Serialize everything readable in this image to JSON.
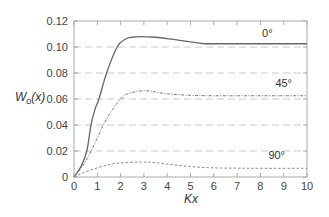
{
  "chart_data": {
    "type": "line",
    "title": "",
    "xlabel": "Kx",
    "ylabel": "W_o(x)",
    "ylabel_parts": {
      "main": "W",
      "sub": "o",
      "arg": "(x)"
    },
    "xlim": [
      0,
      10
    ],
    "ylim": [
      0,
      0.12
    ],
    "x_ticks": [
      0,
      1,
      2,
      3,
      4,
      5,
      6,
      7,
      8,
      9,
      10
    ],
    "x_tick_labels": [
      "0",
      "1",
      "2",
      "3",
      "4",
      "5",
      "6",
      "7",
      "8",
      "9",
      "10"
    ],
    "y_ticks": [
      0,
      0.02,
      0.04,
      0.06,
      0.08,
      0.1,
      0.12
    ],
    "y_tick_labels": [
      "0",
      "0.02",
      "0.04",
      "0.06",
      "0.08",
      "0.10",
      "0.12"
    ],
    "grid": {
      "horizontal": true,
      "vertical": false,
      "style": "dashed",
      "values": [
        0.02,
        0.04,
        0.06,
        0.08,
        0.1
      ]
    },
    "legend": "inline labels",
    "series": [
      {
        "name": "0°",
        "style": "solid",
        "color": "#666666",
        "label_pos": {
          "x": 8.3,
          "y": 0.108
        },
        "x": [
          0,
          0.3,
          0.55,
          0.73,
          0.9,
          1.07,
          1.4,
          1.85,
          2.2,
          2.5,
          2.85,
          3.5,
          4.2,
          5.0,
          5.5,
          6.0,
          8.0,
          10.0
        ],
        "y": [
          0,
          0.008,
          0.02,
          0.04,
          0.052,
          0.06,
          0.08,
          0.1,
          0.106,
          0.1075,
          0.108,
          0.1075,
          0.106,
          0.104,
          0.1027,
          0.1025,
          0.1025,
          0.1025
        ]
      },
      {
        "name": "45°",
        "style": "dash-dot",
        "color": "#777777",
        "label_pos": {
          "x": 9.0,
          "y": 0.069
        },
        "x": [
          0,
          0.5,
          1.0,
          1.3,
          1.7,
          2.1,
          2.5,
          3.0,
          3.5,
          4.0,
          5.0,
          6.0,
          8.0,
          10.0
        ],
        "y": [
          0,
          0.012,
          0.03,
          0.0415,
          0.053,
          0.062,
          0.065,
          0.0664,
          0.0655,
          0.064,
          0.0628,
          0.0625,
          0.0625,
          0.0625
        ]
      },
      {
        "name": "90°",
        "style": "dotted",
        "color": "#888888",
        "label_pos": {
          "x": 8.7,
          "y": 0.0135
        },
        "x": [
          0,
          0.5,
          1.0,
          1.5,
          2.0,
          2.85,
          3.5,
          4.2,
          5.0,
          6.0,
          7.0,
          8.0,
          10.0
        ],
        "y": [
          0,
          0.004,
          0.007,
          0.0095,
          0.0108,
          0.0115,
          0.011,
          0.0095,
          0.008,
          0.007,
          0.0068,
          0.0067,
          0.0067
        ]
      }
    ]
  },
  "colors": {
    "axis": "#aaaaaa",
    "grid": "#c8c8c8",
    "text": "#444444"
  }
}
